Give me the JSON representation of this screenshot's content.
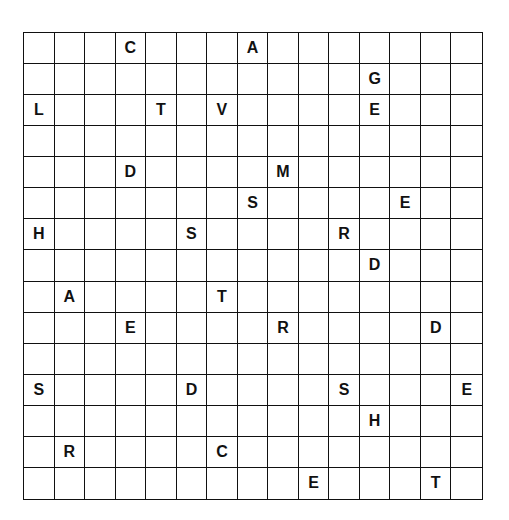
{
  "puzzle": {
    "rows": 15,
    "cols": 15,
    "letters": [
      {
        "r": 0,
        "c": 3,
        "ch": "C"
      },
      {
        "r": 0,
        "c": 7,
        "ch": "A"
      },
      {
        "r": 1,
        "c": 11,
        "ch": "G"
      },
      {
        "r": 2,
        "c": 0,
        "ch": "L"
      },
      {
        "r": 2,
        "c": 4,
        "ch": "T"
      },
      {
        "r": 2,
        "c": 6,
        "ch": "V"
      },
      {
        "r": 2,
        "c": 11,
        "ch": "E"
      },
      {
        "r": 4,
        "c": 3,
        "ch": "D"
      },
      {
        "r": 4,
        "c": 8,
        "ch": "M"
      },
      {
        "r": 5,
        "c": 7,
        "ch": "S"
      },
      {
        "r": 5,
        "c": 12,
        "ch": "E"
      },
      {
        "r": 6,
        "c": 0,
        "ch": "H"
      },
      {
        "r": 6,
        "c": 5,
        "ch": "S"
      },
      {
        "r": 6,
        "c": 10,
        "ch": "R"
      },
      {
        "r": 7,
        "c": 11,
        "ch": "D"
      },
      {
        "r": 8,
        "c": 1,
        "ch": "A"
      },
      {
        "r": 8,
        "c": 6,
        "ch": "T"
      },
      {
        "r": 9,
        "c": 3,
        "ch": "E"
      },
      {
        "r": 9,
        "c": 8,
        "ch": "R"
      },
      {
        "r": 9,
        "c": 13,
        "ch": "D"
      },
      {
        "r": 11,
        "c": 0,
        "ch": "S"
      },
      {
        "r": 11,
        "c": 5,
        "ch": "D"
      },
      {
        "r": 11,
        "c": 10,
        "ch": "S"
      },
      {
        "r": 11,
        "c": 14,
        "ch": "E"
      },
      {
        "r": 12,
        "c": 11,
        "ch": "H"
      },
      {
        "r": 13,
        "c": 1,
        "ch": "R"
      },
      {
        "r": 13,
        "c": 6,
        "ch": "C"
      },
      {
        "r": 14,
        "c": 9,
        "ch": "E"
      },
      {
        "r": 14,
        "c": 13,
        "ch": "T"
      }
    ]
  }
}
